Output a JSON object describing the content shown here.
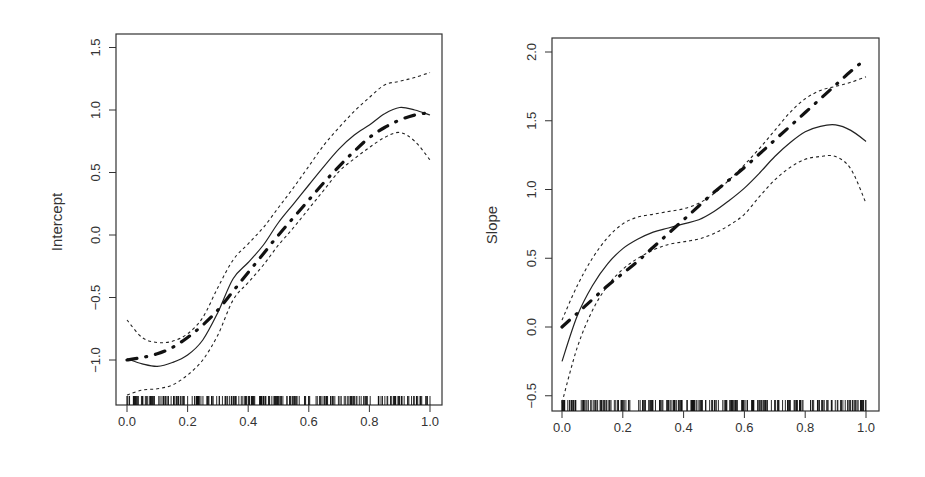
{
  "chart_data": [
    {
      "type": "line",
      "title": "",
      "xlabel": "",
      "ylabel": "Intercept",
      "xlim": [
        0.0,
        1.0
      ],
      "ylim": [
        -1.3,
        1.6
      ],
      "xticks": [
        "0.0",
        "0.2",
        "0.4",
        "0.6",
        "0.8",
        "1.0"
      ],
      "yticks": [
        "-1.0",
        "-0.5",
        "0.0",
        "0.5",
        "1.0",
        "1.5"
      ],
      "grid": false,
      "legend": null,
      "rug": true,
      "x": [
        0.0,
        0.05,
        0.1,
        0.15,
        0.2,
        0.25,
        0.3,
        0.35,
        0.4,
        0.45,
        0.5,
        0.55,
        0.6,
        0.65,
        0.7,
        0.75,
        0.8,
        0.85,
        0.9,
        0.95,
        1.0
      ],
      "series": [
        {
          "name": "Estimate",
          "style": "solid",
          "values": [
            -0.99,
            -1.03,
            -1.05,
            -1.02,
            -0.96,
            -0.84,
            -0.62,
            -0.35,
            -0.22,
            -0.08,
            0.1,
            0.25,
            0.4,
            0.55,
            0.69,
            0.8,
            0.88,
            0.97,
            1.02,
            1.0,
            0.96
          ]
        },
        {
          "name": "Upper band",
          "style": "dashed",
          "values": [
            -0.68,
            -0.82,
            -0.86,
            -0.85,
            -0.79,
            -0.66,
            -0.42,
            -0.2,
            -0.07,
            0.06,
            0.22,
            0.38,
            0.55,
            0.72,
            0.86,
            0.99,
            1.1,
            1.2,
            1.23,
            1.26,
            1.3
          ]
        },
        {
          "name": "Lower band",
          "style": "dashed",
          "values": [
            -1.28,
            -1.24,
            -1.23,
            -1.2,
            -1.12,
            -1.0,
            -0.8,
            -0.52,
            -0.38,
            -0.24,
            -0.08,
            0.06,
            0.21,
            0.36,
            0.51,
            0.61,
            0.7,
            0.78,
            0.82,
            0.75,
            0.6
          ]
        },
        {
          "name": "True function",
          "style": "dash-dot",
          "values": [
            -1.0,
            -0.98,
            -0.95,
            -0.9,
            -0.82,
            -0.72,
            -0.6,
            -0.45,
            -0.3,
            -0.15,
            0.0,
            0.14,
            0.28,
            0.42,
            0.55,
            0.67,
            0.78,
            0.86,
            0.92,
            0.96,
            0.98
          ]
        }
      ]
    },
    {
      "type": "line",
      "title": "",
      "xlabel": "",
      "ylabel": "Slope",
      "xlim": [
        0.0,
        1.0
      ],
      "ylim": [
        -0.6,
        2.1
      ],
      "xticks": [
        "0.0",
        "0.2",
        "0.4",
        "0.6",
        "0.8",
        "1.0"
      ],
      "yticks": [
        "-0.5",
        "0.0",
        "0.5",
        "1.0",
        "1.5",
        "2.0"
      ],
      "grid": false,
      "legend": null,
      "rug": true,
      "x": [
        0.0,
        0.05,
        0.1,
        0.15,
        0.2,
        0.25,
        0.3,
        0.35,
        0.4,
        0.45,
        0.5,
        0.55,
        0.6,
        0.65,
        0.7,
        0.75,
        0.8,
        0.85,
        0.9,
        0.95,
        1.0
      ],
      "series": [
        {
          "name": "Estimate",
          "style": "solid",
          "values": [
            -0.25,
            0.08,
            0.3,
            0.46,
            0.57,
            0.64,
            0.69,
            0.72,
            0.75,
            0.78,
            0.84,
            0.92,
            1.01,
            1.12,
            1.24,
            1.34,
            1.42,
            1.46,
            1.47,
            1.43,
            1.35
          ]
        },
        {
          "name": "Upper band",
          "style": "dashed",
          "values": [
            0.05,
            0.3,
            0.5,
            0.65,
            0.75,
            0.8,
            0.82,
            0.84,
            0.86,
            0.9,
            0.97,
            1.07,
            1.18,
            1.3,
            1.43,
            1.56,
            1.66,
            1.72,
            1.75,
            1.78,
            1.82
          ]
        },
        {
          "name": "Lower band",
          "style": "dashed",
          "values": [
            -0.55,
            -0.15,
            0.12,
            0.3,
            0.42,
            0.5,
            0.56,
            0.6,
            0.62,
            0.64,
            0.68,
            0.74,
            0.82,
            0.95,
            1.07,
            1.16,
            1.22,
            1.24,
            1.24,
            1.15,
            0.9
          ]
        },
        {
          "name": "True function",
          "style": "dash-dot",
          "values": [
            0.0,
            0.1,
            0.2,
            0.3,
            0.39,
            0.48,
            0.58,
            0.68,
            0.78,
            0.88,
            0.98,
            1.07,
            1.16,
            1.26,
            1.36,
            1.46,
            1.56,
            1.66,
            1.76,
            1.86,
            1.95
          ]
        }
      ]
    }
  ],
  "panels": [
    {
      "ylabel": "Intercept",
      "xticks": [
        "0.0",
        "0.2",
        "0.4",
        "0.6",
        "0.8",
        "1.0"
      ],
      "yticks": [
        "-1.0",
        "-0.5",
        "0.0",
        "0.5",
        "1.0",
        "1.5"
      ]
    },
    {
      "ylabel": "Slope",
      "xticks": [
        "0.0",
        "0.2",
        "0.4",
        "0.6",
        "0.8",
        "1.0"
      ],
      "yticks": [
        "-0.5",
        "0.0",
        "0.5",
        "1.0",
        "1.5",
        "2.0"
      ]
    }
  ]
}
